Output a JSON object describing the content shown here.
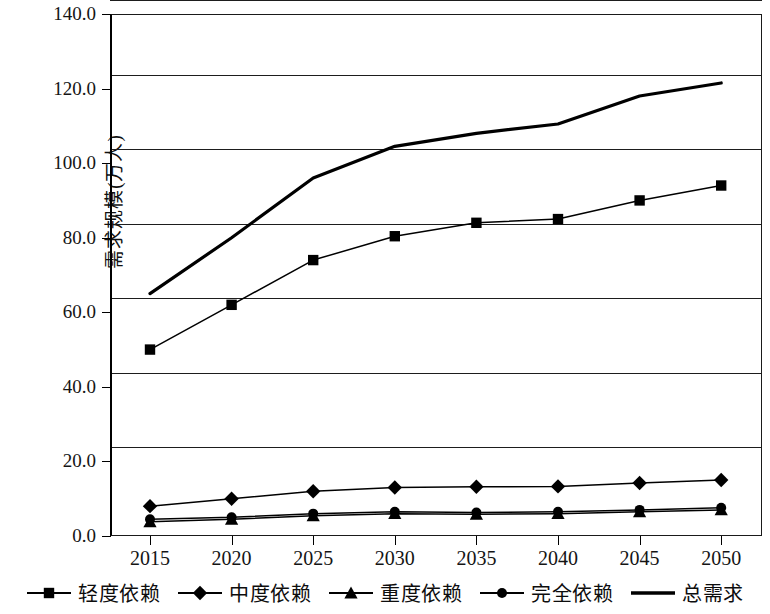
{
  "chart_data": {
    "type": "line",
    "title": "",
    "xlabel": "",
    "ylabel": "需求规模(万人)",
    "categories": [
      "2015",
      "2020",
      "2025",
      "2030",
      "2035",
      "2040",
      "2045",
      "2050"
    ],
    "x_tick_labels": [
      "2015",
      "2020",
      "2025",
      "2030",
      "2035",
      "2040",
      "2045",
      "2050"
    ],
    "y_tick_labels": [
      "0.0",
      "20.0",
      "40.0",
      "60.0",
      "80.0",
      "100.0",
      "120.0",
      "140.0"
    ],
    "y_tick_values": [
      0,
      20,
      40,
      60,
      80,
      100,
      120,
      140
    ],
    "ylim": [
      0,
      140
    ],
    "grid": true,
    "grid_axis": "y",
    "legend_position": "bottom",
    "series": [
      {
        "name": "轻度依赖",
        "marker": "square",
        "values": [
          50.0,
          62.0,
          74.0,
          80.4,
          84.0,
          85.0,
          90.0,
          94.0
        ]
      },
      {
        "name": "中度依赖",
        "marker": "diamond",
        "values": [
          8.0,
          10.0,
          12.0,
          13.0,
          13.2,
          13.3,
          14.2,
          15.0
        ]
      },
      {
        "name": "重度依赖",
        "marker": "triangle",
        "values": [
          3.8,
          4.5,
          5.4,
          6.0,
          5.8,
          6.0,
          6.5,
          7.0
        ]
      },
      {
        "name": "完全依赖",
        "marker": "circle",
        "values": [
          4.5,
          5.0,
          6.0,
          6.5,
          6.3,
          6.5,
          7.0,
          7.6
        ]
      },
      {
        "name": "总需求",
        "marker": "none",
        "values": [
          65.0,
          80.0,
          96.0,
          104.5,
          108.0,
          110.5,
          118.0,
          121.5
        ]
      }
    ],
    "colors": {
      "line": "#000000",
      "grid": "#1d1d1d",
      "axis": "#000000",
      "background": "#ffffff"
    }
  },
  "legend": {
    "items": [
      {
        "label": "轻度依赖",
        "marker": "square"
      },
      {
        "label": "中度依赖",
        "marker": "diamond"
      },
      {
        "label": "重度依赖",
        "marker": "triangle"
      },
      {
        "label": "完全依赖",
        "marker": "circle"
      },
      {
        "label": "总需求",
        "marker": "line"
      }
    ]
  },
  "axes": {
    "y_title": "需求规模(万人)"
  }
}
